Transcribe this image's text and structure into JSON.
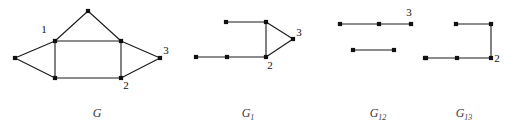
{
  "figure": {
    "width": 514,
    "height": 129,
    "background": "#ffffff",
    "ink_color": "#1a1a1a",
    "node_color": "#111111",
    "caption_color": "#3a3a3a"
  },
  "graphs": [
    {
      "id": "G",
      "caption": "G",
      "caption_base": "G",
      "caption_subscript": "",
      "caption_x": 97,
      "caption_y": 117,
      "nodes": [
        {
          "name": "apex",
          "x": 88,
          "y": 11,
          "label": "",
          "label_x": 0,
          "label_y": 0
        },
        {
          "name": "left",
          "x": 15,
          "y": 58,
          "label": "",
          "label_x": 0,
          "label_y": 0
        },
        {
          "name": "top-left",
          "x": 55,
          "y": 41,
          "label": "1",
          "label_x": 44,
          "label_y": 33
        },
        {
          "name": "top-right",
          "x": 121,
          "y": 41,
          "label": "",
          "label_x": 0,
          "label_y": 0
        },
        {
          "name": "bottom-left",
          "x": 55,
          "y": 78,
          "label": "",
          "label_x": 0,
          "label_y": 0
        },
        {
          "name": "bottom-right",
          "x": 121,
          "y": 78,
          "label": "2",
          "label_x": 126,
          "label_y": 89
        },
        {
          "name": "right",
          "x": 160,
          "y": 58,
          "label": "3",
          "label_x": 166,
          "label_y": 54
        }
      ],
      "edges": [
        [
          "apex",
          "top-left"
        ],
        [
          "apex",
          "top-right"
        ],
        [
          "top-left",
          "top-right"
        ],
        [
          "top-left",
          "left"
        ],
        [
          "left",
          "bottom-left"
        ],
        [
          "top-left",
          "bottom-left"
        ],
        [
          "bottom-left",
          "bottom-right"
        ],
        [
          "top-right",
          "bottom-right"
        ],
        [
          "top-right",
          "right"
        ],
        [
          "bottom-right",
          "right"
        ]
      ]
    },
    {
      "id": "G1",
      "caption": "G₁",
      "caption_base": "G",
      "caption_subscript": "1",
      "caption_x": 248,
      "caption_y": 117,
      "nodes": [
        {
          "name": "upper-left",
          "x": 226,
          "y": 22,
          "label": "",
          "label_x": 0,
          "label_y": 0
        },
        {
          "name": "upper-right",
          "x": 266,
          "y": 22,
          "label": "",
          "label_x": 0,
          "label_y": 0
        },
        {
          "name": "apex-right",
          "x": 293,
          "y": 39,
          "label": "3",
          "label_x": 299,
          "label_y": 36
        },
        {
          "name": "lower-right",
          "x": 266,
          "y": 57,
          "label": "2",
          "label_x": 270,
          "label_y": 69
        },
        {
          "name": "lower-mid",
          "x": 227,
          "y": 57,
          "label": "",
          "label_x": 0,
          "label_y": 0
        },
        {
          "name": "lower-left",
          "x": 196,
          "y": 57,
          "label": "",
          "label_x": 0,
          "label_y": 0
        }
      ],
      "edges": [
        [
          "upper-left",
          "upper-right"
        ],
        [
          "upper-right",
          "apex-right"
        ],
        [
          "upper-right",
          "lower-right"
        ],
        [
          "apex-right",
          "lower-right"
        ],
        [
          "lower-right",
          "lower-mid"
        ],
        [
          "lower-mid",
          "lower-left"
        ]
      ]
    },
    {
      "id": "G12",
      "caption": "G₁₂",
      "caption_base": "G",
      "caption_subscript": "12",
      "caption_x": 378,
      "caption_y": 117,
      "nodes": [
        {
          "name": "top-left",
          "x": 340,
          "y": 24,
          "label": "",
          "label_x": 0,
          "label_y": 0
        },
        {
          "name": "top-mid",
          "x": 379,
          "y": 24,
          "label": "",
          "label_x": 0,
          "label_y": 0
        },
        {
          "name": "top-right",
          "x": 411,
          "y": 24,
          "label": "3",
          "label_x": 409,
          "label_y": 16
        },
        {
          "name": "bottom-left",
          "x": 353,
          "y": 50,
          "label": "",
          "label_x": 0,
          "label_y": 0
        },
        {
          "name": "bottom-right",
          "x": 394,
          "y": 50,
          "label": "",
          "label_x": 0,
          "label_y": 0
        },
        {
          "name": "isolated",
          "x": 425,
          "y": 58,
          "label": "",
          "label_x": 0,
          "label_y": 0
        }
      ],
      "edges": [
        [
          "top-left",
          "top-mid"
        ],
        [
          "top-mid",
          "top-right"
        ],
        [
          "bottom-left",
          "bottom-right"
        ]
      ]
    },
    {
      "id": "G13",
      "caption": "G₁₃",
      "caption_base": "G",
      "caption_subscript": "13",
      "caption_x": 464,
      "caption_y": 117,
      "nodes": [
        {
          "name": "upper-left",
          "x": 456,
          "y": 24,
          "label": "",
          "label_x": 0,
          "label_y": 0
        },
        {
          "name": "upper-right",
          "x": 491,
          "y": 24,
          "label": "",
          "label_x": 0,
          "label_y": 0
        },
        {
          "name": "corner",
          "x": 491,
          "y": 58,
          "label": "2",
          "label_x": 497,
          "label_y": 62
        },
        {
          "name": "bottom-mid",
          "x": 457,
          "y": 58,
          "label": "",
          "label_x": 0,
          "label_y": 0
        },
        {
          "name": "bottom-left",
          "x": 426,
          "y": 58,
          "label": "",
          "label_x": 0,
          "label_y": 0
        }
      ],
      "edges": [
        [
          "upper-left",
          "upper-right"
        ],
        [
          "upper-right",
          "corner"
        ],
        [
          "corner",
          "bottom-mid"
        ],
        [
          "bottom-mid",
          "bottom-left"
        ]
      ]
    }
  ]
}
